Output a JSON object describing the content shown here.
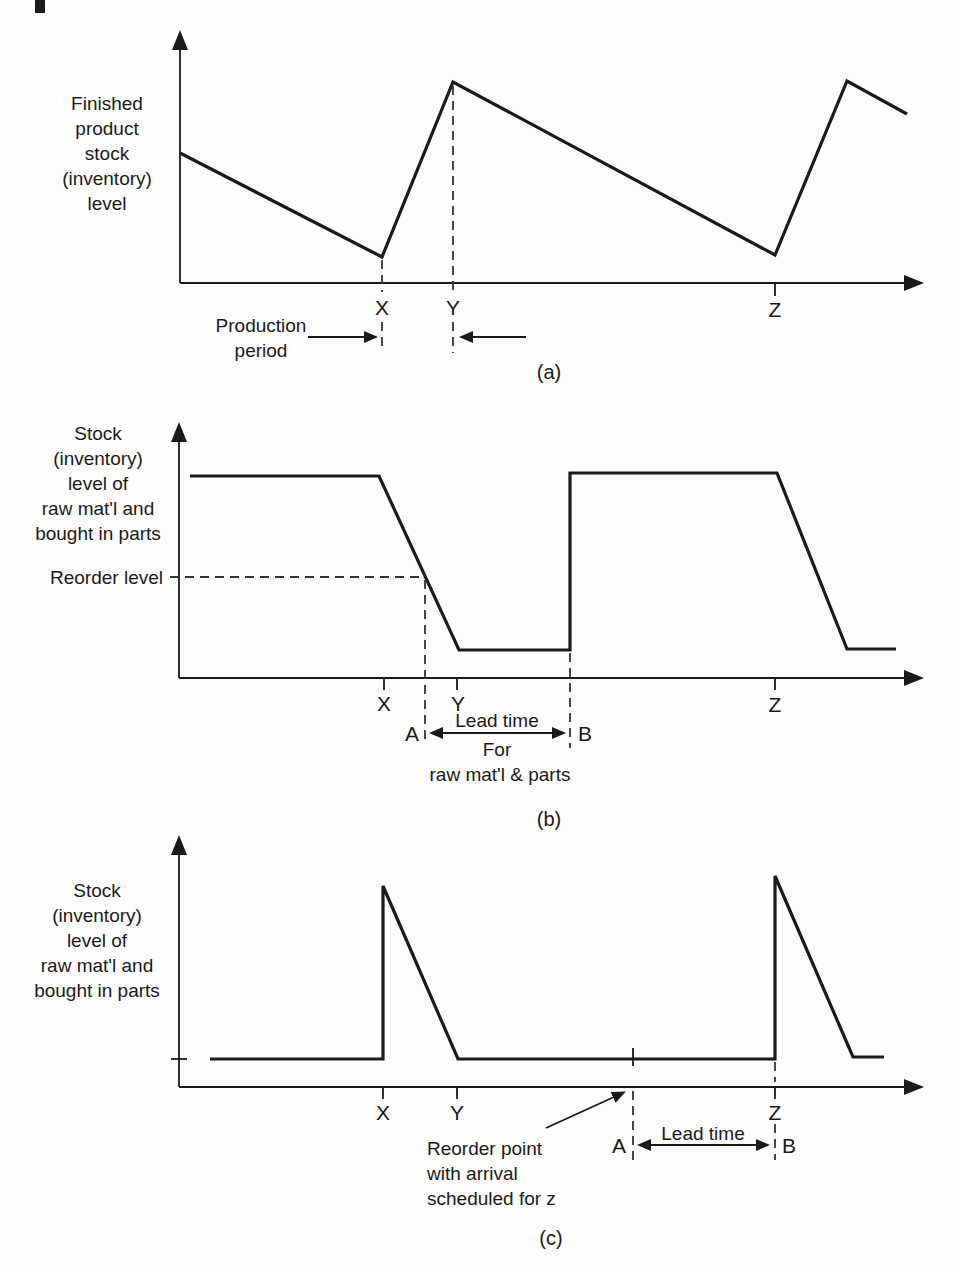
{
  "figure": {
    "colors": {
      "ink": "#1a1a1a",
      "background": "#fdfdfc"
    },
    "charts": [
      {
        "id": "a",
        "caption": "(a)",
        "y_axis_label_lines": [
          "Finished",
          "product",
          "stock",
          "(inventory)",
          "level"
        ],
        "x_tick_labels": [
          "X",
          "Y",
          "Z"
        ],
        "annotations": {
          "production_period_lines": [
            "Production",
            "period"
          ]
        }
      },
      {
        "id": "b",
        "caption": "(b)",
        "y_axis_label_lines": [
          "Stock",
          "(inventory)",
          "level of",
          "raw mat'l and",
          "bought in parts"
        ],
        "reorder_level_label": "Reorder level",
        "x_tick_labels": [
          "X",
          "Y",
          "Z"
        ],
        "point_labels": {
          "a": "A",
          "b": "B"
        },
        "lead_time_lines": [
          "Lead time",
          "For",
          "raw mat'l & parts"
        ]
      },
      {
        "id": "c",
        "caption": "(c)",
        "y_axis_label_lines": [
          "Stock",
          "(inventory)",
          "level of",
          "raw mat'l and",
          "bought in parts"
        ],
        "x_tick_labels": [
          "X",
          "Y",
          "Z"
        ],
        "point_labels": {
          "a": "A",
          "b": "B"
        },
        "lead_time_label": "Lead time",
        "reorder_note_lines": [
          "Reorder point",
          "with arrival",
          "scheduled for z"
        ]
      }
    ]
  }
}
